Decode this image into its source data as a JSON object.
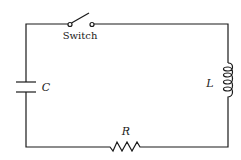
{
  "diagram": {
    "type": "series RLC circuit",
    "components": {
      "switch": {
        "label": "Switch",
        "state": "open"
      },
      "capacitor": {
        "label": "C"
      },
      "inductor": {
        "label": "L"
      },
      "resistor": {
        "label": "R"
      }
    },
    "colors": {
      "ink": "#1a1a1a",
      "background": "#ffffff"
    }
  }
}
